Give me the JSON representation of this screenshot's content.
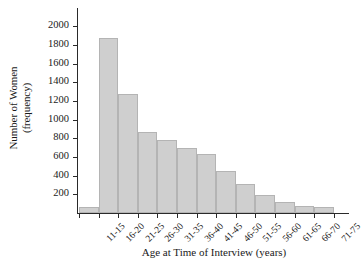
{
  "chart_data": {
    "type": "bar",
    "title": "",
    "xlabel": "Age at Time of Interview (years)",
    "ylabel_line1": "Number of Women",
    "ylabel_line2": "(frequency)",
    "categories": [
      "11-15",
      "16-20",
      "21-25",
      "26-30",
      "31-35",
      "36-40",
      "41-45",
      "46-50",
      "51-55",
      "56-60",
      "61-65",
      "66-70",
      "71-75"
    ],
    "values": [
      60,
      1880,
      1270,
      870,
      780,
      700,
      630,
      450,
      310,
      190,
      120,
      75,
      65
    ],
    "ylim": [
      0,
      2100
    ],
    "yticks": [
      200,
      400,
      600,
      800,
      1000,
      1200,
      1400,
      1600,
      1800,
      2000
    ],
    "ytick_labels": [
      "200",
      "400",
      "600",
      "800",
      "1000",
      "1200",
      "1400",
      "1600",
      "1800",
      "2000"
    ],
    "grid": false,
    "legend": "none",
    "bar_fill_color": "#cfcfcf",
    "bar_edge_color": "#b4b4b4",
    "axis_color": "#2a2a2a"
  }
}
